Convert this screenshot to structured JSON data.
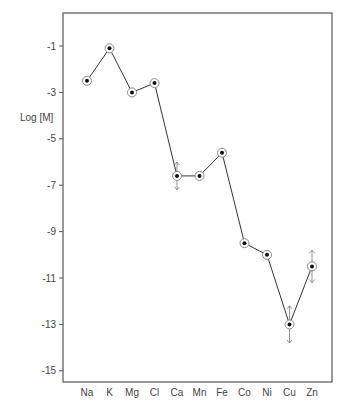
{
  "chart_data": {
    "type": "line",
    "title": "",
    "xlabel": "",
    "ylabel": "Log [M]",
    "categories": [
      "Na",
      "K",
      "Mg",
      "Cl",
      "Ca",
      "Mn",
      "Fe",
      "Co",
      "Ni",
      "Cu",
      "Zn"
    ],
    "series": [
      {
        "name": "Log [M]",
        "values": [
          -2.5,
          -1.1,
          -3.0,
          -2.6,
          -6.6,
          -6.6,
          -5.6,
          -9.5,
          -10.0,
          -13.0,
          -10.5
        ]
      }
    ],
    "error_arrows": [
      {
        "category": "Ca",
        "up": 0.6,
        "down": 0.6
      },
      {
        "category": "Cu",
        "up": 0.8,
        "down": 0.8
      },
      {
        "category": "Zn",
        "up": 0.7,
        "down": 0.7
      }
    ],
    "yticks": [
      -1,
      -3,
      -5,
      -7,
      -9,
      -11,
      -13,
      -15
    ],
    "ylim": [
      -15.5,
      0.4
    ],
    "grid": false,
    "legend": "none",
    "colors": {
      "line": "#333333",
      "marker_fill": "#111111",
      "frame": "#555555",
      "ring": "#888888"
    }
  }
}
